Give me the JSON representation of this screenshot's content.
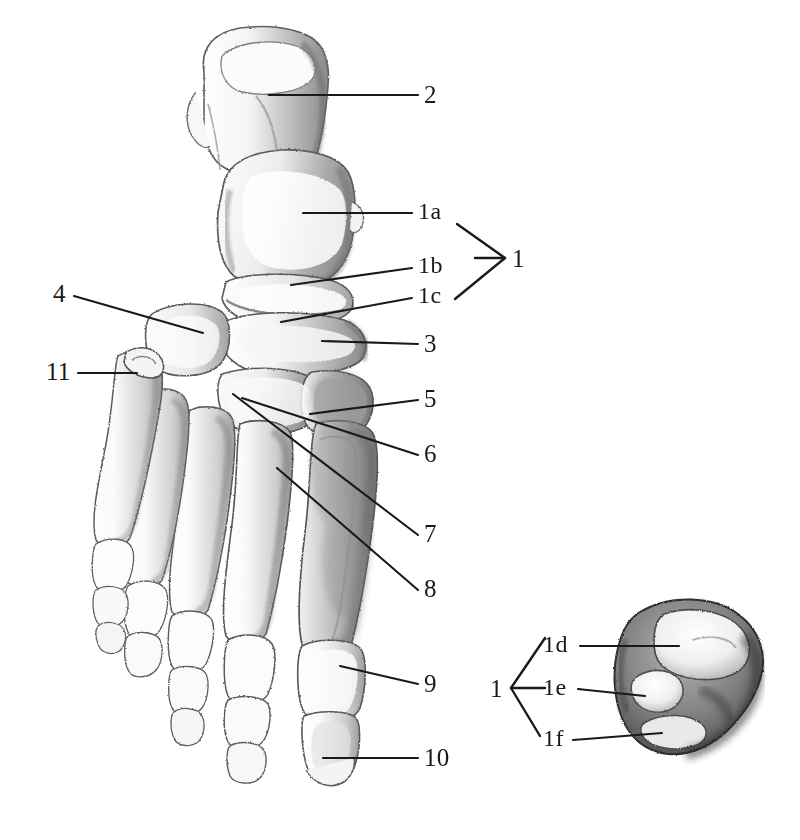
{
  "plate": {
    "title": "Skeleton of the foot, dorsal view, with inferior view of the talus",
    "background_color": "#ffffff",
    "ink_color": "#191919",
    "pencil_tone": "#8d8d8d",
    "width": 800,
    "height": 840
  },
  "main_figure": {
    "name": "foot-skeleton-dorsal-view",
    "description": "Pencil drawing of the bones of the right foot seen from above, calcaneus at top, toes at lower left"
  },
  "inset_figure": {
    "name": "talus-inferior-view",
    "description": "Pencil drawing of the underside of the talus showing three articular facets"
  },
  "labels": [
    {
      "id": "label-2",
      "text": "2",
      "x": 424,
      "y": 82,
      "leader": {
        "x1": 418,
        "y1": 95,
        "x2": 269,
        "y2": 95
      }
    },
    {
      "id": "label-1a",
      "text": "1a",
      "x": 418,
      "y": 199,
      "leader": {
        "x1": 412,
        "y1": 213,
        "x2": 303,
        "y2": 213
      }
    },
    {
      "id": "label-1b",
      "text": "1b",
      "x": 418,
      "y": 253,
      "leader": {
        "x1": 412,
        "y1": 268,
        "x2": 291,
        "y2": 285
      }
    },
    {
      "id": "label-1c",
      "text": "1c",
      "x": 418,
      "y": 283,
      "leader": {
        "x1": 412,
        "y1": 298,
        "x2": 281,
        "y2": 322
      }
    },
    {
      "id": "label-1-main",
      "text": "1",
      "x": 512,
      "y": 246,
      "leader": null
    },
    {
      "id": "label-3",
      "text": "3",
      "x": 424,
      "y": 331,
      "leader": {
        "x1": 418,
        "y1": 344,
        "x2": 322,
        "y2": 341
      }
    },
    {
      "id": "label-5",
      "text": "5",
      "x": 424,
      "y": 386,
      "leader": {
        "x1": 418,
        "y1": 400,
        "x2": 310,
        "y2": 414
      }
    },
    {
      "id": "label-6",
      "text": "6",
      "x": 424,
      "y": 441,
      "leader": {
        "x1": 418,
        "y1": 455,
        "x2": 242,
        "y2": 398
      }
    },
    {
      "id": "label-7",
      "text": "7",
      "x": 424,
      "y": 521,
      "leader": {
        "x1": 418,
        "y1": 535,
        "x2": 233,
        "y2": 394
      }
    },
    {
      "id": "label-8",
      "text": "8",
      "x": 424,
      "y": 576,
      "leader": {
        "x1": 418,
        "y1": 590,
        "x2": 277,
        "y2": 468
      }
    },
    {
      "id": "label-9",
      "text": "9",
      "x": 424,
      "y": 671,
      "leader": {
        "x1": 418,
        "y1": 684,
        "x2": 340,
        "y2": 666
      }
    },
    {
      "id": "label-10",
      "text": "10",
      "x": 424,
      "y": 745,
      "leader": {
        "x1": 418,
        "y1": 758,
        "x2": 323,
        "y2": 758
      }
    },
    {
      "id": "label-4",
      "text": "4",
      "x": 53,
      "y": 281,
      "leader": {
        "x1": 74,
        "y1": 296,
        "x2": 203,
        "y2": 333
      }
    },
    {
      "id": "label-11",
      "text": "11",
      "x": 46,
      "y": 359,
      "leader": {
        "x1": 78,
        "y1": 373,
        "x2": 137,
        "y2": 373
      }
    },
    {
      "id": "label-1d",
      "text": "1d",
      "x": 543,
      "y": 632,
      "leader": {
        "x1": 580,
        "y1": 646,
        "x2": 679,
        "y2": 646
      }
    },
    {
      "id": "label-1e",
      "text": "1e",
      "x": 543,
      "y": 675,
      "leader": {
        "x1": 578,
        "y1": 689,
        "x2": 645,
        "y2": 696
      }
    },
    {
      "id": "label-1f",
      "text": "1f",
      "x": 543,
      "y": 726,
      "leader": {
        "x1": 573,
        "y1": 740,
        "x2": 662,
        "y2": 733
      }
    },
    {
      "id": "label-1-inset",
      "text": "1",
      "x": 490,
      "y": 676,
      "leader": null
    }
  ],
  "brackets": {
    "main": {
      "name": "bracket-1-main",
      "orientation": "right-pointing",
      "apex": {
        "x": 505,
        "y": 258
      },
      "top": {
        "x": 457,
        "y": 224
      },
      "bottom": {
        "x": 455,
        "y": 299
      },
      "stem": {
        "x1": 475,
        "y1": 258,
        "x2": 505,
        "y2": 258
      }
    },
    "inset": {
      "name": "bracket-1-inset",
      "orientation": "left-pointing",
      "apex": {
        "x": 511,
        "y": 688
      },
      "top": {
        "x": 545,
        "y": 638
      },
      "bottom": {
        "x": 540,
        "y": 736
      },
      "stem": {
        "x1": 511,
        "y1": 688,
        "x2": 545,
        "y2": 688
      }
    }
  }
}
